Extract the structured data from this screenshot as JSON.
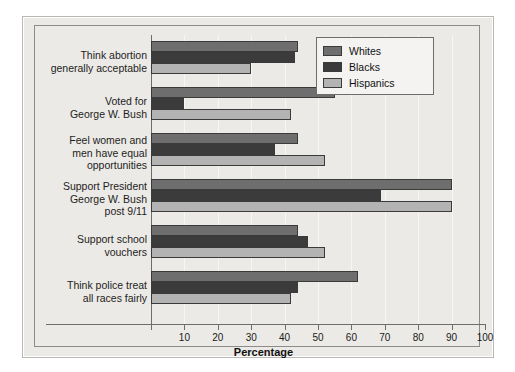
{
  "chart_data": {
    "type": "bar",
    "orientation": "horizontal",
    "title": "",
    "subtitle": "",
    "xlabel": "Percentage",
    "ylabel": "",
    "xlim": [
      0,
      100
    ],
    "xticks": [
      0,
      10,
      20,
      30,
      40,
      50,
      60,
      70,
      80,
      90,
      100
    ],
    "xtick_labels": [
      "",
      "10",
      "20",
      "30",
      "40",
      "50",
      "60",
      "70",
      "80",
      "90",
      "100"
    ],
    "grid": false,
    "legend_position": "top-right",
    "categories": [
      "Think abortion generally acceptable",
      "Voted for George W. Bush",
      "Feel women and men have equal opportunities",
      "Support President George W. Bush post 9/11",
      "Support school vouchers",
      "Think police treat all races fairly"
    ],
    "category_lines": [
      [
        "Think abortion",
        "generally acceptable"
      ],
      [
        "Voted for",
        "George W. Bush"
      ],
      [
        "Feel women and",
        "men have equal",
        "opportunities"
      ],
      [
        "Support President",
        "George W. Bush",
        "post 9/11"
      ],
      [
        "Support school",
        "vouchers"
      ],
      [
        "Think police treat",
        "all races fairly"
      ]
    ],
    "series": [
      {
        "name": "Whites",
        "color": "#6e6e6e",
        "values": [
          44,
          55,
          44,
          90,
          44,
          62
        ]
      },
      {
        "name": "Blacks",
        "color": "#3b3b3b",
        "values": [
          43,
          10,
          37,
          69,
          47,
          44
        ]
      },
      {
        "name": "Hispanics",
        "color": "#b3b3b3",
        "values": [
          30,
          42,
          52,
          90,
          52,
          42
        ]
      }
    ]
  },
  "legend": {
    "items": [
      {
        "label": "Whites"
      },
      {
        "label": "Blacks"
      },
      {
        "label": "Hispanics"
      }
    ]
  },
  "axis": {
    "xlabel": "Percentage"
  }
}
